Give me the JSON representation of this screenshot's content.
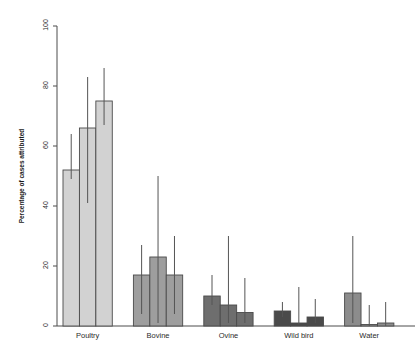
{
  "chart_data": {
    "type": "bar",
    "title": "",
    "subtitle": "",
    "xlabel": "",
    "ylabel": "Percentage of cases attributed",
    "categories": [
      "Poultry",
      "Bovine",
      "Ovine",
      "Wild bird",
      "Water"
    ],
    "ylim": [
      0,
      100
    ],
    "yticks": [
      0,
      20,
      40,
      60,
      80,
      100
    ],
    "ytick_labels": [
      "0",
      "20",
      "40",
      "60",
      "80",
      "100"
    ],
    "grid": false,
    "legend": "none",
    "series": [
      {
        "name": "Model 1",
        "color": "#d4d4d4",
        "values": [
          52,
          17,
          10,
          5,
          11
        ],
        "err_low": [
          49,
          4,
          7,
          3,
          1
        ],
        "err_high": [
          64,
          27,
          17,
          8,
          30
        ]
      },
      {
        "name": "Model 2",
        "color": "#cfcfcf",
        "values": [
          66,
          23,
          7,
          1,
          0.5
        ],
        "err_low": [
          41,
          1,
          1,
          0.5,
          0
        ],
        "err_high": [
          83,
          50,
          30,
          13,
          7
        ]
      },
      {
        "name": "Model 3",
        "color": "#c9c9c9",
        "values": [
          75,
          17,
          4.5,
          3,
          1
        ],
        "err_low": [
          67,
          4,
          1,
          1,
          0
        ],
        "err_high": [
          86,
          30,
          16,
          9,
          8
        ]
      }
    ],
    "group_colors": [
      "#d2d2d2",
      "#9e9e9e",
      "#6e6e6e",
      "#4a4a4a",
      "#8c8c8c"
    ],
    "axis_color": "#4d4d4d",
    "bar_border_color": "#4a4a4a",
    "error_bar_color": "#555555"
  }
}
